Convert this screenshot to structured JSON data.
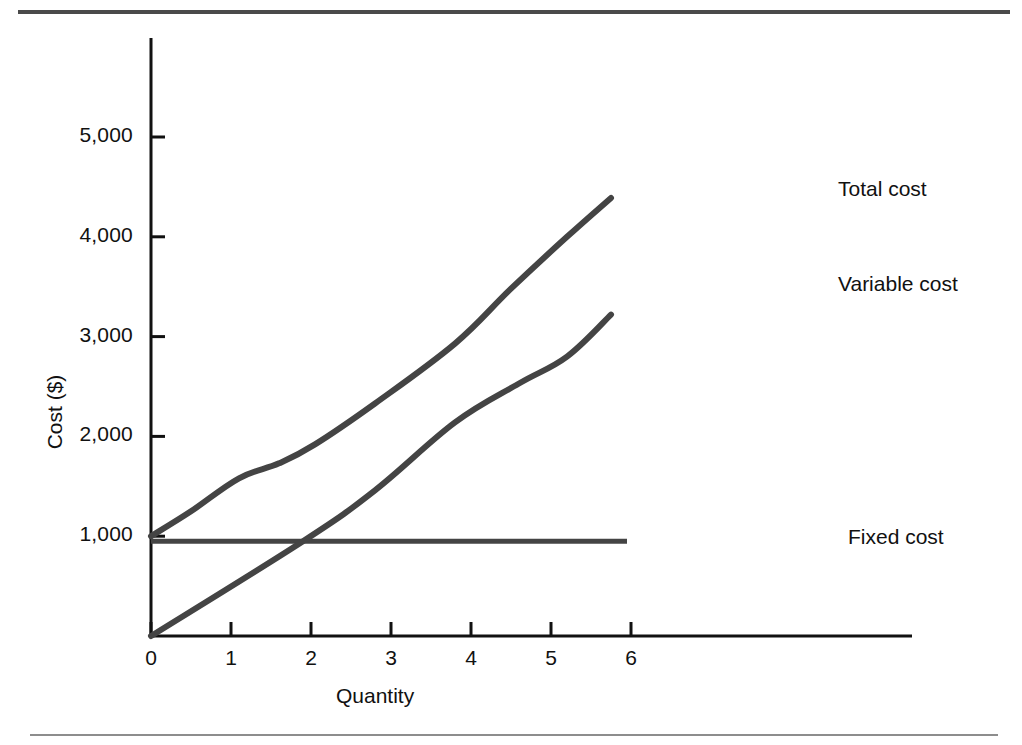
{
  "figure": {
    "background_color": "#ffffff",
    "line_color": "#444444",
    "axis_color": "#111111",
    "rule_top_color": "#4a4a4a",
    "rule_bottom_color": "#8d8d8d"
  },
  "chart_data": {
    "type": "line",
    "title": "",
    "xlabel": "Quantity",
    "ylabel": "Cost ($)",
    "xlim": [
      0,
      6.9
    ],
    "ylim": [
      0,
      5900
    ],
    "grid": false,
    "legend": "inline-right-labels",
    "xticks": [
      "0",
      "1",
      "2",
      "3",
      "4",
      "5",
      "6"
    ],
    "xtick_values": [
      0,
      1,
      2,
      3,
      4,
      5,
      6
    ],
    "yticks": [
      "1,000",
      "2,000",
      "3,000",
      "4,000",
      "5,000"
    ],
    "ytick_values": [
      1000,
      2000,
      3000,
      4000,
      5000
    ],
    "series": [
      {
        "name": "Total cost",
        "label": "Total cost",
        "x": [
          0.0,
          0.5,
          1.1,
          1.6,
          2.05,
          2.8,
          3.8,
          4.5,
          5.2,
          5.75
        ],
        "y": [
          1000,
          1250,
          1580,
          1730,
          1920,
          2330,
          2930,
          3480,
          4000,
          4390
        ]
      },
      {
        "name": "Variable cost",
        "label": "Variable cost",
        "x": [
          0.0,
          1.9,
          2.8,
          3.8,
          4.6,
          5.2,
          5.75
        ],
        "y": [
          0,
          950,
          1460,
          2140,
          2530,
          2800,
          3220
        ]
      },
      {
        "name": "Fixed cost",
        "label": "Fixed cost",
        "x": [
          0.0,
          5.95
        ],
        "y": [
          950,
          950
        ]
      }
    ]
  },
  "labels": {
    "total_cost": "Total cost",
    "variable_cost": "Variable cost",
    "fixed_cost": "Fixed cost"
  }
}
